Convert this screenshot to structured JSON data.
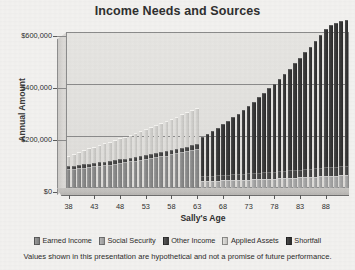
{
  "chart_data": {
    "type": "bar",
    "stacked": true,
    "title": "Income Needs and Sources",
    "xlabel": "Sally's Age",
    "ylabel": "Annual Amount",
    "ylim": [
      0,
      600000
    ],
    "yticks": [
      0,
      200000,
      400000,
      600000
    ],
    "ytick_labels": [
      "$0",
      "$200,000",
      "$400,000",
      "$600,000"
    ],
    "xticks": [
      38,
      43,
      48,
      53,
      58,
      63,
      68,
      73,
      78,
      83,
      88
    ],
    "grid": true,
    "legend_position": "bottom",
    "categories": [
      38,
      39,
      40,
      41,
      42,
      43,
      44,
      45,
      46,
      47,
      48,
      49,
      50,
      51,
      52,
      53,
      54,
      55,
      56,
      57,
      58,
      59,
      60,
      61,
      62,
      63,
      64,
      65,
      66,
      67,
      68,
      69,
      70,
      71,
      72,
      73,
      74,
      75,
      76,
      77,
      78,
      79,
      80,
      81,
      82,
      83,
      84,
      85,
      86,
      87,
      88,
      89,
      90,
      91,
      92
    ],
    "series": [
      {
        "name": "Earned Income",
        "color": "#8c8c8c",
        "values": [
          72000,
          74000,
          76000,
          78000,
          80000,
          83000,
          85000,
          88000,
          90000,
          93000,
          96000,
          99000,
          102000,
          105000,
          108000,
          111000,
          115000,
          118000,
          122000,
          125000,
          129000,
          133000,
          137000,
          141000,
          146000,
          150000,
          0,
          0,
          0,
          0,
          0,
          0,
          0,
          0,
          0,
          0,
          0,
          0,
          0,
          0,
          0,
          0,
          0,
          0,
          0,
          0,
          0,
          0,
          0,
          0,
          0,
          0,
          0,
          0,
          0
        ]
      },
      {
        "name": "Social Security",
        "color": "#a8a8a8",
        "values": [
          0,
          0,
          0,
          0,
          0,
          0,
          0,
          0,
          0,
          0,
          0,
          0,
          0,
          0,
          0,
          0,
          0,
          0,
          0,
          0,
          0,
          0,
          0,
          0,
          0,
          0,
          26000,
          27000,
          27500,
          28000,
          29000,
          29500,
          30000,
          31000,
          32000,
          32500,
          33000,
          34000,
          35000,
          36000,
          36500,
          37000,
          38000,
          39000,
          40000,
          41000,
          42000,
          43000,
          44000,
          45000,
          46000,
          47000,
          48000,
          49000,
          50000
        ]
      },
      {
        "name": "Other Income",
        "color": "#4a4a4a",
        "values": [
          12000,
          12000,
          12500,
          12500,
          13000,
          13000,
          13500,
          13500,
          14000,
          14000,
          14500,
          14500,
          15000,
          15000,
          15500,
          16000,
          16000,
          16500,
          16500,
          17000,
          17500,
          17500,
          18000,
          18500,
          19000,
          19000,
          19500,
          20000,
          20500,
          21000,
          21500,
          22000,
          22500,
          23000,
          23500,
          24000,
          24500,
          25000,
          25500,
          26000,
          26500,
          27000,
          28000,
          28500,
          29000,
          30000,
          30500,
          31000,
          32000,
          32500,
          33000,
          34000,
          34500,
          35000,
          36000
        ]
      },
      {
        "name": "Applied Assets",
        "color": "#d4d3d0",
        "values": [
          40000,
          45000,
          50000,
          55000,
          60000,
          62000,
          66000,
          70000,
          74000,
          78000,
          82000,
          84000,
          88000,
          92000,
          96000,
          100000,
          104000,
          108000,
          112000,
          116000,
          120000,
          124000,
          128000,
          132000,
          136000,
          140000,
          0,
          0,
          0,
          0,
          0,
          0,
          0,
          0,
          0,
          0,
          0,
          0,
          0,
          0,
          0,
          0,
          0,
          0,
          0,
          0,
          0,
          0,
          0,
          0,
          0,
          0,
          0,
          0,
          0
        ]
      },
      {
        "name": "Shortfall",
        "color": "#3a3a3a",
        "values": [
          0,
          0,
          0,
          0,
          0,
          0,
          0,
          0,
          0,
          0,
          0,
          0,
          0,
          0,
          0,
          0,
          0,
          0,
          0,
          0,
          0,
          0,
          0,
          0,
          0,
          0,
          150000,
          160000,
          171000,
          182000,
          194000,
          206000,
          219000,
          232000,
          246000,
          260000,
          275000,
          290000,
          306000,
          322000,
          339000,
          356000,
          374000,
          392000,
          411000,
          430000,
          450000,
          470000,
          491000,
          512000,
          534000,
          545000,
          552000,
          558000,
          562000
        ]
      }
    ],
    "legend": [
      {
        "label": "Earned Income",
        "color": "#8c8c8c"
      },
      {
        "label": "Social Security",
        "color": "#a8a8a8"
      },
      {
        "label": "Other Income",
        "color": "#4a4a4a"
      },
      {
        "label": "Applied Assets",
        "color": "#d4d3d0"
      },
      {
        "label": "Shortfall",
        "color": "#3a3a3a"
      }
    ],
    "footnote": "Values shown in this presentation are hypothetical and not a promise of future performance."
  }
}
